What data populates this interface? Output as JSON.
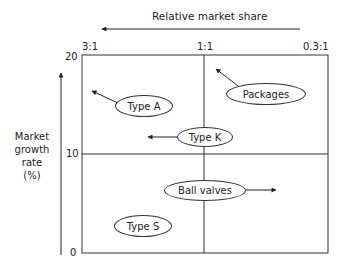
{
  "diagram": {
    "type": "BCG growth-share matrix",
    "x_axis": {
      "title": "Relative market share",
      "ticks": [
        "3:1",
        "1:1",
        "0.3:1"
      ],
      "arrow_direction": "left"
    },
    "y_axis": {
      "title_lines": [
        "Market",
        "growth",
        "rate",
        "(%)"
      ],
      "ticks": [
        "20",
        "10",
        "0"
      ],
      "arrow_direction": "up"
    },
    "items": [
      {
        "label": "Type A",
        "arrow": "up-left"
      },
      {
        "label": "Packages",
        "arrow": "up-left"
      },
      {
        "label": "Type K",
        "arrow": "left"
      },
      {
        "label": "Ball valves",
        "arrow": "right"
      },
      {
        "label": "Type S",
        "arrow": "none"
      }
    ]
  }
}
